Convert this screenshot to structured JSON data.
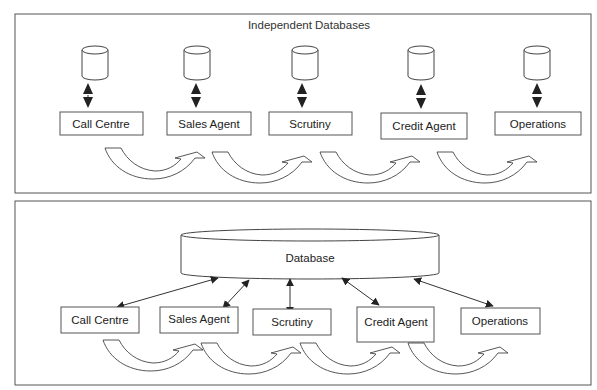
{
  "diagram": {
    "top_panel": {
      "title": "Independent Databases",
      "agents": [
        {
          "label": "Call Centre"
        },
        {
          "label": "Sales Agent"
        },
        {
          "label": "Scrutiny"
        },
        {
          "label": "Credit Agent"
        },
        {
          "label": "Operations"
        }
      ]
    },
    "bottom_panel": {
      "database_label": "Database",
      "agents": [
        {
          "label": "Call Centre"
        },
        {
          "label": "Sales Agent"
        },
        {
          "label": "Scrutiny"
        },
        {
          "label": "Credit Agent"
        },
        {
          "label": "Operations"
        }
      ]
    },
    "colors": {
      "stroke": "#444444",
      "arrowhead": "#222222",
      "background": "#ffffff"
    }
  }
}
